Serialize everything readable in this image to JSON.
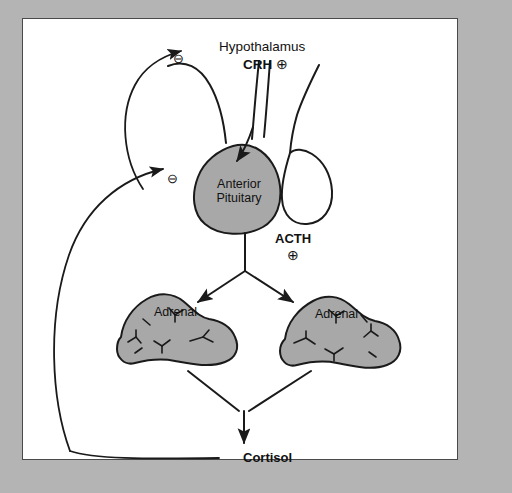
{
  "figure": {
    "title_text": "Hypothalamic-pituitary-adrenal axis",
    "panel_background": "#ffffff",
    "matte_color": "#b4b4b4",
    "organ_fill": "#a8a8a8",
    "stroke_color": "#1a1a1a"
  },
  "labels": {
    "hypothalamus": "Hypothalamus",
    "crh": "CRH",
    "crh_sign": "⊕",
    "anterior_pituitary_line1": "Anterior",
    "anterior_pituitary_line2": "Pituitary",
    "acth": "ACTH",
    "acth_sign": "⊕",
    "adrenal_left": "Adrenal",
    "adrenal_right": "Adrenal",
    "cortisol": "Cortisol"
  },
  "feedback": {
    "long_loop_sign": "⊖",
    "short_loop_sign": "⊖",
    "long_loop_target": "Hypothalamus",
    "short_loop_target": "Anterior Pituitary",
    "source": "Cortisol"
  },
  "flow": [
    {
      "from": "Hypothalamus",
      "to": "Anterior Pituitary",
      "mediator": "CRH",
      "sign": "⊕"
    },
    {
      "from": "Anterior Pituitary",
      "to": "Adrenal",
      "mediator": "ACTH",
      "sign": "⊕"
    },
    {
      "from": "Adrenal",
      "to": "Cortisol",
      "mediator": "",
      "sign": ""
    },
    {
      "from": "Cortisol",
      "to": "Hypothalamus",
      "mediator": "",
      "sign": "⊖"
    },
    {
      "from": "Cortisol",
      "to": "Anterior Pituitary",
      "mediator": "",
      "sign": "⊖"
    }
  ]
}
